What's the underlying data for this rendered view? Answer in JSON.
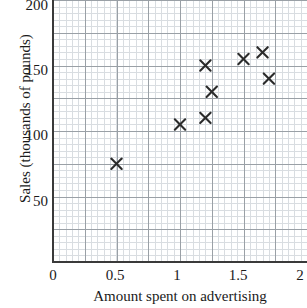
{
  "chart_data": {
    "type": "scatter",
    "title": "",
    "xlabel": "Amount spent on advertising",
    "ylabel": "Sales (thousands of pounds)",
    "xlim": [
      0,
      2
    ],
    "ylim": [
      0,
      200
    ],
    "xticks": [
      "0",
      "0.5",
      "1",
      "1.5",
      "2"
    ],
    "xtick_values": [
      0,
      0.5,
      1,
      1.5,
      2
    ],
    "yticks": [
      "50",
      "100",
      "150",
      "200"
    ],
    "ytick_values": [
      50,
      100,
      150,
      200
    ],
    "grid": true,
    "grid_major_step_x": 0.25,
    "grid_major_step_y": 25,
    "grid_minor_step_x": 0.05,
    "grid_minor_step_y": 5,
    "legend": null,
    "marker": "x",
    "marker_color": "#2b2b2b",
    "grid_major_color": "#9aa0a6",
    "grid_minor_color": "#d9dde1",
    "axis_color": "#3a3a3a",
    "points": [
      {
        "x": 0.5,
        "y": 75
      },
      {
        "x": 1.0,
        "y": 105
      },
      {
        "x": 1.2,
        "y": 110
      },
      {
        "x": 1.2,
        "y": 150
      },
      {
        "x": 1.25,
        "y": 130
      },
      {
        "x": 1.5,
        "y": 155
      },
      {
        "x": 1.65,
        "y": 160
      },
      {
        "x": 1.7,
        "y": 140
      }
    ]
  }
}
